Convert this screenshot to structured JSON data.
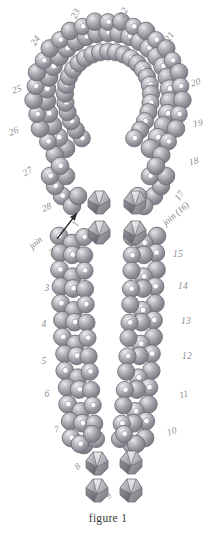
{
  "figure": {
    "caption": "figure 1",
    "background_color": "#ffffff",
    "bead_color": "#8d8d92",
    "bead_highlight_color": "#d8d8dc",
    "bead_outline_color": "#6f6f75",
    "bead_hole_color": "#ffffff",
    "bicone_light_color": "#e2e2e4",
    "bicone_mid_color": "#a9a9ae",
    "bicone_dark_color": "#6c6c72",
    "label_color": "#8e8e92",
    "caption_color": "#3a3a3a"
  },
  "labels": [
    {
      "id": "step-23",
      "text": "23",
      "x": 76,
      "y": 14,
      "rot": -62
    },
    {
      "id": "step-22",
      "text": "22",
      "x": 124,
      "y": 13,
      "rot": -62
    },
    {
      "id": "step-24",
      "text": "24",
      "x": 36,
      "y": 41,
      "rot": -55
    },
    {
      "id": "step-21",
      "text": "21",
      "x": 170,
      "y": 37,
      "rot": -58
    },
    {
      "id": "step-25",
      "text": "25",
      "x": 17,
      "y": 90,
      "rot": -18
    },
    {
      "id": "step-20",
      "text": "20",
      "x": 196,
      "y": 83,
      "rot": -16
    },
    {
      "id": "step-26",
      "text": "26",
      "x": 14,
      "y": 132,
      "rot": -22
    },
    {
      "id": "step-19",
      "text": "19",
      "x": 198,
      "y": 124,
      "rot": -10
    },
    {
      "id": "step-27",
      "text": "27",
      "x": 28,
      "y": 172,
      "rot": -30
    },
    {
      "id": "step-18",
      "text": "18",
      "x": 194,
      "y": 162,
      "rot": -14
    },
    {
      "id": "step-28",
      "text": "28",
      "x": 47,
      "y": 208,
      "rot": -22
    },
    {
      "id": "step-17",
      "text": "17",
      "x": 180,
      "y": 196,
      "rot": -55
    },
    {
      "id": "step-1",
      "text": "1",
      "x": 76,
      "y": 224,
      "rot": -62
    },
    {
      "id": "step-2",
      "text": "2",
      "x": 52,
      "y": 253,
      "rot": -26
    },
    {
      "id": "step-15",
      "text": "15",
      "x": 178,
      "y": 255,
      "rot": 0
    },
    {
      "id": "step-3",
      "text": "3",
      "x": 47,
      "y": 289,
      "rot": 0
    },
    {
      "id": "step-14",
      "text": "14",
      "x": 183,
      "y": 287,
      "rot": 0
    },
    {
      "id": "step-4",
      "text": "4",
      "x": 44,
      "y": 325,
      "rot": 0
    },
    {
      "id": "step-13",
      "text": "13",
      "x": 186,
      "y": 322,
      "rot": 0
    },
    {
      "id": "step-5",
      "text": "5",
      "x": 44,
      "y": 362,
      "rot": 0
    },
    {
      "id": "step-12",
      "text": "12",
      "x": 187,
      "y": 357,
      "rot": 0
    },
    {
      "id": "step-6",
      "text": "6",
      "x": 47,
      "y": 395,
      "rot": 0
    },
    {
      "id": "step-11",
      "text": "11",
      "x": 184,
      "y": 395,
      "rot": -12
    },
    {
      "id": "step-7",
      "text": "7",
      "x": 57,
      "y": 430,
      "rot": -16
    },
    {
      "id": "step-10",
      "text": "10",
      "x": 172,
      "y": 432,
      "rot": -18
    },
    {
      "id": "step-8",
      "text": "8",
      "x": 78,
      "y": 467,
      "rot": -42
    },
    {
      "id": "step-9",
      "text": "9",
      "x": 109,
      "y": 496,
      "rot": -62
    }
  ],
  "annotations": {
    "join_left": {
      "text": "join",
      "x": 36,
      "y": 243,
      "rot": -42
    },
    "join_right": {
      "text": "join (16)",
      "x": 176,
      "y": 214,
      "rot": -40
    },
    "arrow": {
      "from_x": 57,
      "from_y": 239,
      "to_x": 77,
      "to_y": 213
    }
  },
  "structure": {
    "loop_beads": 0,
    "stem_beads": 0,
    "bicone_groups": [
      {
        "name": "upper-bicones",
        "count": 4
      },
      {
        "name": "lower-bicones",
        "count": 4
      }
    ]
  }
}
